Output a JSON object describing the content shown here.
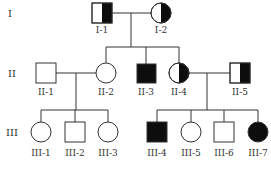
{
  "diagram": {
    "type": "pedigree",
    "colors": {
      "affected": "#0d0d0d",
      "unaffected": "#ffffff",
      "line": "#333333"
    },
    "generations": [
      {
        "label": "I",
        "individuals": [
          {
            "id": "I-1",
            "sex": "male",
            "status": "carrier-half-right"
          },
          {
            "id": "I-2",
            "sex": "female",
            "status": "carrier-half-right"
          }
        ]
      },
      {
        "label": "II",
        "individuals": [
          {
            "id": "II-1",
            "sex": "male",
            "status": "unaffected"
          },
          {
            "id": "II-2",
            "sex": "female",
            "status": "unaffected"
          },
          {
            "id": "II-3",
            "sex": "male",
            "status": "affected"
          },
          {
            "id": "II-4",
            "sex": "female",
            "status": "carrier-half-right"
          },
          {
            "id": "II-5",
            "sex": "male",
            "status": "carrier-half-right"
          }
        ]
      },
      {
        "label": "III",
        "individuals": [
          {
            "id": "III-1",
            "sex": "female",
            "status": "unaffected"
          },
          {
            "id": "III-2",
            "sex": "male",
            "status": "unaffected"
          },
          {
            "id": "III-3",
            "sex": "female",
            "status": "unaffected"
          },
          {
            "id": "III-4",
            "sex": "male",
            "status": "affected"
          },
          {
            "id": "III-5",
            "sex": "female",
            "status": "unaffected"
          },
          {
            "id": "III-6",
            "sex": "male",
            "status": "unaffected"
          },
          {
            "id": "III-7",
            "sex": "female",
            "status": "affected"
          }
        ]
      }
    ],
    "matings": [
      {
        "partners": [
          "I-1",
          "I-2"
        ],
        "children": [
          "II-2",
          "II-3",
          "II-4"
        ]
      },
      {
        "partners": [
          "II-1",
          "II-2"
        ],
        "children": [
          "III-1",
          "III-2",
          "III-3"
        ]
      },
      {
        "partners": [
          "II-4",
          "II-5"
        ],
        "children": [
          "III-4",
          "III-5",
          "III-6",
          "III-7"
        ]
      }
    ]
  }
}
